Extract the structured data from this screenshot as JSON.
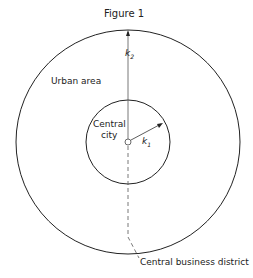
{
  "figure": {
    "title": "Figure 1",
    "labels": {
      "urban_area": "Urban area",
      "central_city_line1": "Central",
      "central_city_line2": "city",
      "k1": "k",
      "k1_sub": "1",
      "k2": "k",
      "k2_sub": "2",
      "cbd": "Central business district"
    },
    "colors": {
      "line": "#222222",
      "background": "#ffffff"
    }
  }
}
